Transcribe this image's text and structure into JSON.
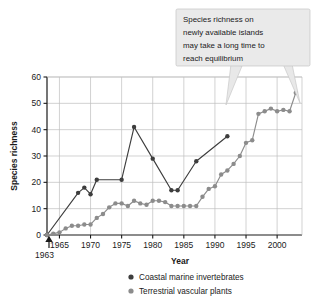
{
  "chart_data": {
    "type": "line",
    "title": "",
    "xlabel": "Year",
    "ylabel": "Species richness",
    "xlim": [
      1963,
      2004
    ],
    "ylim": [
      0,
      60
    ],
    "yticks": [
      0,
      10,
      20,
      30,
      40,
      50,
      60
    ],
    "xticks": [
      1965,
      1970,
      1975,
      1980,
      1985,
      1990,
      1995,
      2000
    ],
    "grid": true,
    "legend_position": "below-right",
    "origin_note": "1963",
    "annotation": "Species richness on newly available islands may take a long time to reach equilibrium",
    "annotation_lines": [
      "Species richness on",
      "newly available islands",
      "may take a long time to",
      "reach equilibrium"
    ],
    "series": [
      {
        "name": "Coastal marine invertebrates",
        "color": "#3d3d3d",
        "x": [
          1963,
          1968,
          1969,
          1970,
          1971,
          1975,
          1977,
          1980,
          1983,
          1984,
          1987,
          1992
        ],
        "values": [
          0,
          16,
          18,
          15.5,
          21,
          21,
          41,
          29,
          17,
          17,
          28,
          37.5
        ]
      },
      {
        "name": "Terrestrial vascular plants",
        "color": "#8c8c8c",
        "x": [
          1963,
          1964,
          1965,
          1966,
          1967,
          1968,
          1969,
          1970,
          1971,
          1972,
          1973,
          1974,
          1975,
          1976,
          1977,
          1978,
          1979,
          1980,
          1981,
          1982,
          1983,
          1984,
          1985,
          1986,
          1987,
          1988,
          1989,
          1990,
          1991,
          1992,
          1993,
          1994,
          1995,
          1996,
          1997,
          1998,
          1999,
          2000,
          2001,
          2002,
          2003
        ],
        "values": [
          0,
          0.5,
          1,
          2.5,
          3.5,
          3.5,
          4,
          4,
          6.5,
          8,
          10.5,
          12,
          12,
          11,
          13,
          12,
          11.5,
          13,
          13,
          12.5,
          11,
          11,
          11,
          11,
          11,
          14.5,
          17.5,
          18.5,
          23,
          24.5,
          27,
          30,
          35,
          36,
          46,
          47,
          48,
          47,
          47.5,
          47,
          54
        ]
      }
    ]
  },
  "legend": {
    "items": [
      {
        "label": "Coastal marine invertebrates",
        "color": "#3d3d3d"
      },
      {
        "label": "Terrestrial vascular plants",
        "color": "#8c8c8c"
      }
    ]
  }
}
